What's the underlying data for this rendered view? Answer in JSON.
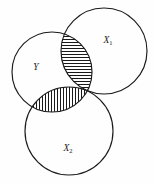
{
  "figure": {
    "kind": "venn-diagram",
    "background_color": "#fefefe",
    "stroke_color": "#1a1a1a",
    "hatch_color": "#1a1a1a",
    "width": 154,
    "height": 184
  },
  "sets": [
    {
      "id": "x1",
      "label": "X",
      "subscript": "1",
      "label_x": 108,
      "label_y": 41,
      "cx": 104,
      "cy": 51,
      "r": 43
    },
    {
      "id": "y",
      "label": "Y",
      "subscript": "",
      "label_x": 36,
      "label_y": 68,
      "cx": 52,
      "cy": 72,
      "r": 40
    },
    {
      "id": "x2",
      "label": "X",
      "subscript": "2",
      "label_x": 68,
      "label_y": 149,
      "cx": 69,
      "cy": 131,
      "r": 44
    }
  ],
  "shaded_regions": [
    {
      "id": "y-int-x1",
      "name": "intersection-y-x1",
      "hatch": "horizontal",
      "hatch_spacing": 3,
      "sets": [
        "y",
        "x1"
      ]
    },
    {
      "id": "y-int-x2",
      "name": "intersection-y-x2",
      "hatch": "vertical",
      "hatch_spacing": 3,
      "sets": [
        "y",
        "x2"
      ]
    }
  ]
}
